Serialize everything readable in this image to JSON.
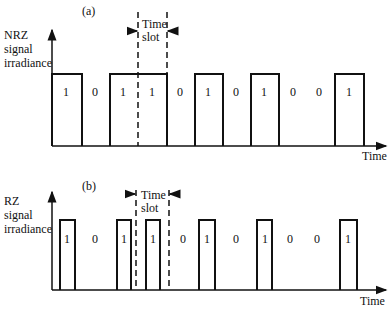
{
  "panels": [
    {
      "tag": "(a)",
      "ylabel_lines": [
        "NRZ",
        "signal",
        "irradiance"
      ],
      "xlabel": "Time",
      "slot_label_lines": [
        "Time",
        "slot"
      ],
      "bits": [
        "1",
        "0",
        "1",
        "1",
        "0",
        "1",
        "0",
        "1",
        "0",
        "0",
        "1"
      ]
    },
    {
      "tag": "(b)",
      "ylabel_lines": [
        "RZ",
        "signal",
        "irradiance"
      ],
      "xlabel": "Time",
      "slot_label_lines": [
        "Time",
        "slot"
      ],
      "bits": [
        "1",
        "0",
        "1",
        "1",
        "0",
        "1",
        "0",
        "1",
        "0",
        "0",
        "1"
      ]
    }
  ]
}
